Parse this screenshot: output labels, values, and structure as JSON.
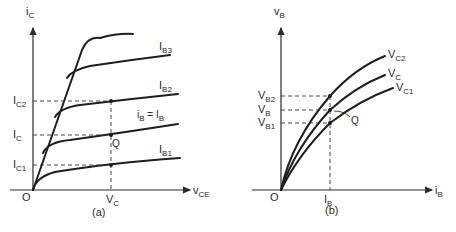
{
  "figure": {
    "panel_a": {
      "caption": "(a)",
      "y_axis_label": {
        "main": "i",
        "sub": "C"
      },
      "x_axis_label": {
        "main": "v",
        "sub": "CE"
      },
      "origin_label": "O",
      "x_tick": {
        "main": "V",
        "sub": "C"
      },
      "y_ticks": [
        {
          "main": "I",
          "sub": "C2"
        },
        {
          "main": "I",
          "sub": "C"
        },
        {
          "main": "I",
          "sub": "C1"
        }
      ],
      "curve_labels": [
        {
          "main": "I",
          "sub": "B3"
        },
        {
          "main": "I",
          "sub": "B2"
        },
        {
          "main": "i",
          "sub": "B",
          "rest": " = I",
          "sub2": "B"
        },
        {
          "main": "I",
          "sub": "B1"
        }
      ],
      "point_label": "Q"
    },
    "panel_b": {
      "caption": "(b)",
      "y_axis_label": {
        "main": "v",
        "sub": "B"
      },
      "x_axis_label": {
        "main": "i",
        "sub": "B"
      },
      "origin_label": "O",
      "x_tick": {
        "main": "I",
        "sub": "B"
      },
      "y_ticks": [
        {
          "main": "V",
          "sub": "B2"
        },
        {
          "main": "V",
          "sub": "B"
        },
        {
          "main": "V",
          "sub": "B1"
        }
      ],
      "curve_labels": [
        {
          "main": "V",
          "sub": "C2"
        },
        {
          "main": "V",
          "sub": "C"
        },
        {
          "main": "V",
          "sub": "C1"
        }
      ],
      "point_label": "Q"
    }
  }
}
